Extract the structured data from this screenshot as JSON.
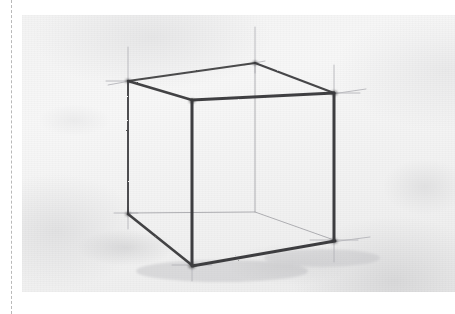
{
  "scene": {
    "kind": "scanned-page-photograph",
    "subject": "freehand pencil perspective drawing of a wireframe cube",
    "medium": "graphite pencil on textured drawing paper",
    "page_background": "#ffffff",
    "paper_color": "#f4f4f4",
    "graphite_color": "#3a3a3c",
    "construction_line_color": "#b0b0b4",
    "hidden_edge_color": "#9d9da2"
  },
  "cut_guide": {
    "name": "dashed trim line",
    "orientation": "vertical",
    "x": 11,
    "color": "#b9b9b9",
    "style": "dashed"
  },
  "edge_mark": {
    "text": "",
    "note": "faint cropped glyph at left page edge"
  },
  "photo": {
    "x": 22,
    "y": 15,
    "width": 433,
    "height": 277
  },
  "chart_data": {
    "type": "scatter",
    "xlabel": "",
    "ylabel": "",
    "xlim": [
      0,
      433
    ],
    "ylim": [
      0,
      277
    ],
    "grid": false,
    "legend": "none",
    "annotations": [
      "construction lines overshoot each vertex",
      "near-vertical edges drawn with pronounced pressure",
      "back vertical edge and two back base edges drawn faintly as hidden lines"
    ],
    "categories": [
      "top-back",
      "top-left",
      "top-front",
      "top-right",
      "bottom-back",
      "bottom-left",
      "bottom-front",
      "bottom-right"
    ],
    "series": [
      {
        "name": "cube vertices (px within photo)",
        "points": [
          {
            "label": "top-back",
            "x": 233,
            "y": 48,
            "visible": true,
            "weight": "medium"
          },
          {
            "label": "top-left",
            "x": 106,
            "y": 66,
            "visible": true,
            "weight": "medium"
          },
          {
            "label": "top-front",
            "x": 170,
            "y": 85,
            "visible": true,
            "weight": "heavy"
          },
          {
            "label": "top-right",
            "x": 312,
            "y": 78,
            "visible": true,
            "weight": "heavy"
          },
          {
            "label": "bottom-back",
            "x": 233,
            "y": 197,
            "visible": false,
            "weight": "faint"
          },
          {
            "label": "bottom-left",
            "x": 106,
            "y": 198,
            "visible": true,
            "weight": "medium"
          },
          {
            "label": "bottom-front",
            "x": 170,
            "y": 250,
            "visible": true,
            "weight": "heavy"
          },
          {
            "label": "bottom-right",
            "x": 312,
            "y": 225,
            "visible": true,
            "weight": "heavy"
          }
        ]
      }
    ],
    "edges": [
      {
        "name": "top-back-to-top-left",
        "from": "top-back",
        "to": "top-left",
        "style": "visible",
        "weight": 2.0
      },
      {
        "name": "top-back-to-top-right",
        "from": "top-back",
        "to": "top-right",
        "style": "visible",
        "weight": 2.2
      },
      {
        "name": "top-left-to-top-front",
        "from": "top-left",
        "to": "top-front",
        "style": "visible",
        "weight": 2.6
      },
      {
        "name": "top-right-to-top-front",
        "from": "top-right",
        "to": "top-front",
        "style": "visible",
        "weight": 2.8
      },
      {
        "name": "left-vertical",
        "from": "top-left",
        "to": "bottom-left",
        "style": "visible",
        "weight": 2.0
      },
      {
        "name": "front-vertical",
        "from": "top-front",
        "to": "bottom-front",
        "style": "visible",
        "weight": 3.0
      },
      {
        "name": "right-vertical",
        "from": "top-right",
        "to": "bottom-right",
        "style": "visible",
        "weight": 3.0
      },
      {
        "name": "back-vertical",
        "from": "top-back",
        "to": "bottom-back",
        "style": "hidden",
        "weight": 1.0
      },
      {
        "name": "bottom-left-to-front",
        "from": "bottom-left",
        "to": "bottom-front",
        "style": "visible",
        "weight": 2.8
      },
      {
        "name": "bottom-right-to-front",
        "from": "bottom-right",
        "to": "bottom-front",
        "style": "visible",
        "weight": 3.0
      },
      {
        "name": "bottom-back-to-left",
        "from": "bottom-back",
        "to": "bottom-left",
        "style": "hidden",
        "weight": 1.0
      },
      {
        "name": "bottom-back-to-right",
        "from": "bottom-back",
        "to": "bottom-right",
        "style": "hidden",
        "weight": 1.0
      }
    ],
    "construction_overshoots": [
      {
        "name": "top-left-cross",
        "x": 106,
        "y": 66,
        "up": 34,
        "down": 10,
        "left": 22,
        "right": 8
      },
      {
        "name": "top-back-cross",
        "x": 233,
        "y": 48,
        "up": 36,
        "down": 10,
        "left": 8,
        "right": 8
      },
      {
        "name": "top-right-cross",
        "x": 312,
        "y": 78,
        "up": 28,
        "down": 10,
        "left": 8,
        "right": 26
      },
      {
        "name": "bottom-front-cross",
        "x": 170,
        "y": 250,
        "up": 6,
        "down": 16,
        "left": 20,
        "right": 20
      },
      {
        "name": "bottom-right-cross",
        "x": 312,
        "y": 225,
        "up": 6,
        "down": 22,
        "left": 24,
        "right": 24
      },
      {
        "name": "bottom-left-cross",
        "x": 106,
        "y": 198,
        "up": 6,
        "down": 16,
        "left": 14,
        "right": 10
      }
    ]
  }
}
